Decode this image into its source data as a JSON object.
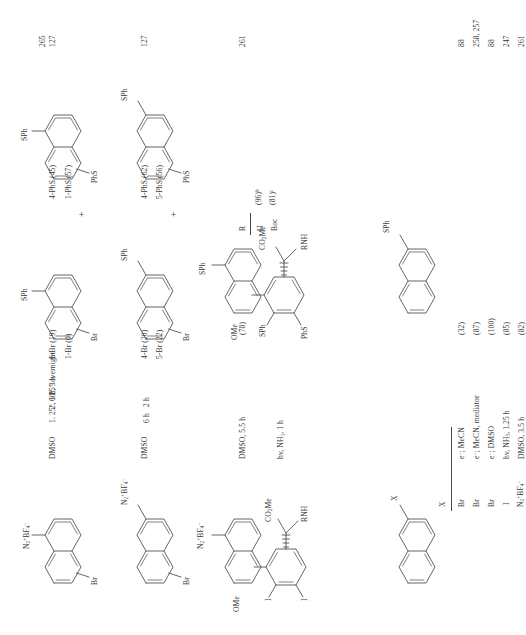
{
  "page": {
    "kind": "chemistry-reaction-table",
    "orientation": "rotated-90-ccw",
    "column_headers": {
      "substrate": "",
      "conditions": "",
      "products": "",
      "refs": ""
    }
  },
  "rows": [
    {
      "id": "row-1",
      "substrate": {
        "name": "methyl 2-amino-2-(4-methoxy-3,5-diiodophenyl)acetate",
        "labels": [
          "OMe",
          "I",
          "I",
          "RNH",
          "CO",
          "2",
          "Me"
        ]
      },
      "conditions": [
        "hv, NH3, 1 h"
      ],
      "conditions_display": "hv, NH₃, 1 h",
      "product": {
        "name": "methyl 2-amino-2-(4-methoxy-3,5-bis(phenylthio)phenyl)acetate",
        "labels": [
          "OMe",
          "SPh",
          "PhS",
          "RNH",
          "CO2Me"
        ]
      },
      "subtable": {
        "header": "R",
        "entries": [
          {
            "r": "H",
            "yield": "(96)",
            "note": "b"
          },
          {
            "r": "Boc",
            "yield": "(81)",
            "note": "c"
          }
        ]
      },
      "refs": [
        "265"
      ]
    },
    {
      "id": "row-2",
      "substrate": {
        "name": "1-substituted naphthalene",
        "labels": [
          "X"
        ],
        "xtable": {
          "header": "X",
          "values": [
            "Br",
            "Br",
            "Br",
            "I",
            "N2+BF4-"
          ],
          "values_display": [
            "Br",
            "Br",
            "Br",
            "I",
            "N₂⁺BF₄⁻"
          ]
        }
      },
      "conditions": [
        "e-; MeCN",
        "e-; MeCN, mediator",
        "e-; DMSO",
        "hv, NH3, 1.25 h",
        "DMSO, 3.5 h"
      ],
      "conditions_display": [
        "e⁻; MeCN",
        "e⁻; MeCN, mediator",
        "e⁻; DMSO",
        "hv, NH₃, 1.25 h",
        "DMSO, 3.5 h"
      ],
      "product": {
        "name": "1-(phenylthio)naphthalene",
        "labels": [
          "SPh"
        ]
      },
      "yields": [
        "(32)",
        "(87)",
        "(100)",
        "(85)",
        "(82)"
      ],
      "refs": [
        "88",
        "258, 257",
        "88",
        "247",
        "261"
      ]
    },
    {
      "id": "row-3",
      "substrate": {
        "name": "naphthalene-2-diazonium tetrafluoroborate",
        "labels": [
          "N2+BF4-"
        ],
        "labels_display": [
          "N₂⁺BF₄⁻"
        ]
      },
      "conditions": [
        "DMSO, 5.5 h"
      ],
      "conditions_display": [
        "DMSO, 5.5 h"
      ],
      "product": {
        "name": "2-(phenylthio)naphthalene",
        "labels": [
          "SPh"
        ]
      },
      "yields": [
        "(78)"
      ],
      "refs": [
        "261"
      ]
    },
    {
      "id": "row-4",
      "substrate": {
        "name": "4-bromonaphthalene-1-diazonium tetrafluoroborate",
        "labels": [
          "N2+BF4-",
          "Br"
        ],
        "labels_display": [
          "N₂⁺BF₄⁻",
          "Br"
        ]
      },
      "conditions": [
        "DMSO",
        "6 h",
        "2 h"
      ],
      "conditions_display": [
        "DMSO",
        "6 h",
        "2 h"
      ],
      "products": [
        {
          "name": "bromo(phenylthio)naphthalene",
          "labels": [
            "SPh",
            "Br"
          ],
          "yields": [
            "4-Br (20)",
            "5-Br (22)"
          ]
        },
        {
          "name": "bis(phenylthio)naphthalene",
          "labels": [
            "SPh",
            "PhS"
          ],
          "yields": [
            "4-PhS (62)",
            "5-PhS (56)"
          ]
        }
      ],
      "operator": "+",
      "refs": [
        "127"
      ]
    },
    {
      "id": "row-5",
      "substrate": {
        "name": "6-bromonaphthalene-2-diazonium tetrafluoroborate",
        "labels": [
          "N2+BF4-",
          "Br"
        ],
        "labels_display": [
          "N₂⁺BF₄⁻",
          "Br"
        ]
      },
      "conditions": [
        "DMSO",
        "1. 25°, 1 h",
        "2. 60°, 3 h",
        "25° overnight"
      ],
      "conditions_display": [
        "DMSO",
        "1. 25°, 1 h",
        "2. 60°, 3 h",
        "25° overnight"
      ],
      "products": [
        {
          "name": "bromo(phenylthio)naphthalene",
          "labels": [
            "SPh",
            "Br"
          ],
          "yields": [
            "6-Br (19)",
            "1-Br (0)"
          ]
        },
        {
          "name": "bis(phenylthio)naphthalene",
          "labels": [
            "SPh",
            "PhS"
          ],
          "yields": [
            "4-PhS (45)",
            "1-PhS (57)"
          ]
        }
      ],
      "operator": "+",
      "refs": [
        "127"
      ]
    }
  ],
  "glyphs": {
    "plus": "+",
    "ome": "OMe",
    "sph": "SPh",
    "phs": "PhS",
    "br": "Br",
    "iodine": "I",
    "rnh": "RNH",
    "co2me_head": "CO",
    "co2me_sub": "2",
    "co2me_tail": "Me",
    "x": "X",
    "r_header": "R",
    "h": "H",
    "boc": "Boc"
  }
}
